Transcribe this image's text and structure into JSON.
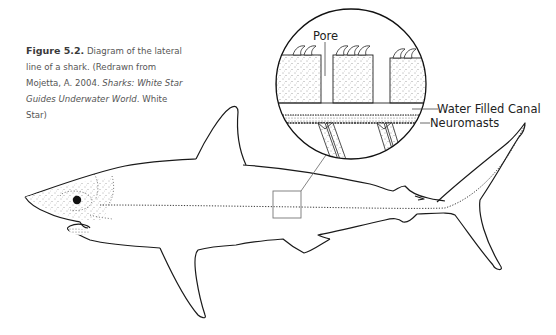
{
  "caption": {
    "figure_number": "Figure 5.2.",
    "text": " Diagram of the lateral line of a shark. (Redrawn from Mojetta, A. 2004. ",
    "italic_title": "Sharks: White Star Guides Underwater World",
    "tail": ". White Star)"
  },
  "labels": {
    "pore": "Pore",
    "water_filled_canal": "Water Filled Canal",
    "neuromasts": "Neuromasts"
  },
  "colors": {
    "line": "#1a1a1a",
    "text": "#555555",
    "box": "#777777"
  }
}
